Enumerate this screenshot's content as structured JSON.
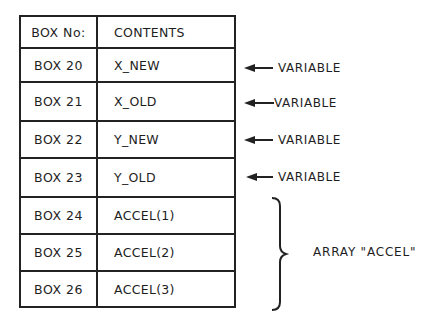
{
  "table": {
    "headers": [
      "BOX No:",
      "CONTENTS"
    ],
    "rows": [
      {
        "box": "BOX 20",
        "contents": "X_NEW"
      },
      {
        "box": "BOX 21",
        "contents": "X_OLD"
      },
      {
        "box": "BOX 22",
        "contents": "Y_NEW"
      },
      {
        "box": "BOX 23",
        "contents": "Y_OLD"
      },
      {
        "box": "BOX 24",
        "contents": "ACCEL(1)"
      },
      {
        "box": "BOX 25",
        "contents": "ACCEL(2)"
      },
      {
        "box": "BOX 26",
        "contents": "ACCEL(3)"
      }
    ]
  },
  "annotations": {
    "variables": [
      "VARIABLE",
      "VARIABLE",
      "VARIABLE",
      "VARIABLE"
    ],
    "array_label": "ARRAY \"ACCEL\""
  },
  "colors": {
    "line": "#222222",
    "text": "#1e1e1e",
    "background": "#ffffff"
  }
}
